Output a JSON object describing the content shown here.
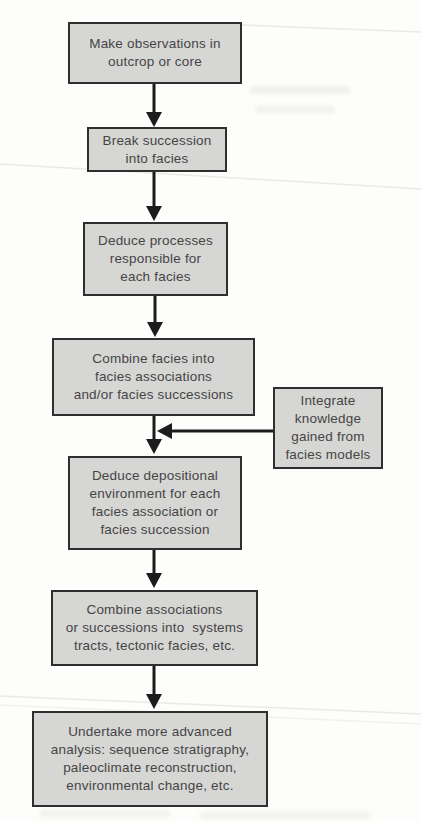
{
  "flowchart": {
    "type": "flowchart",
    "colors": {
      "background": "#fdfdfb",
      "box_fill": "#d6d6d4",
      "box_border": "#2f2f2f",
      "text": "#454545",
      "arrow": "#1c1c1c",
      "artifact": "#e9e9e5"
    },
    "nodes": [
      {
        "id": "observe",
        "label": "Make observations in\noutcrop or core"
      },
      {
        "id": "break-succession",
        "label": "Break succession\ninto facies"
      },
      {
        "id": "deduce-processes",
        "label": "Deduce processes\nresponsible for\neach facies"
      },
      {
        "id": "combine-facies",
        "label": "Combine facies into\nfacies associations\nand/or facies successions"
      },
      {
        "id": "integrate-knowledge",
        "label": "Integrate\nknowledge\ngained from\nfacies models"
      },
      {
        "id": "deduce-environment",
        "label": "Deduce depositional\nenvironment for each\nfacies association or\nfacies succession"
      },
      {
        "id": "combine-associations",
        "label": "Combine associations\nor successions into  systems\ntracts, tectonic facies, etc."
      },
      {
        "id": "undertake-analysis",
        "label": "Undertake more advanced\nanalysis: sequence stratigraphy,\npaleoclimate reconstruction,\nenvironmental change, etc."
      }
    ],
    "edges": [
      {
        "from": "observe",
        "to": "break-succession"
      },
      {
        "from": "break-succession",
        "to": "deduce-processes"
      },
      {
        "from": "deduce-processes",
        "to": "combine-facies"
      },
      {
        "from": "combine-facies",
        "to": "deduce-environment"
      },
      {
        "from": "integrate-knowledge",
        "to": "deduce-environment"
      },
      {
        "from": "deduce-environment",
        "to": "combine-associations"
      },
      {
        "from": "combine-associations",
        "to": "undertake-analysis"
      }
    ]
  }
}
